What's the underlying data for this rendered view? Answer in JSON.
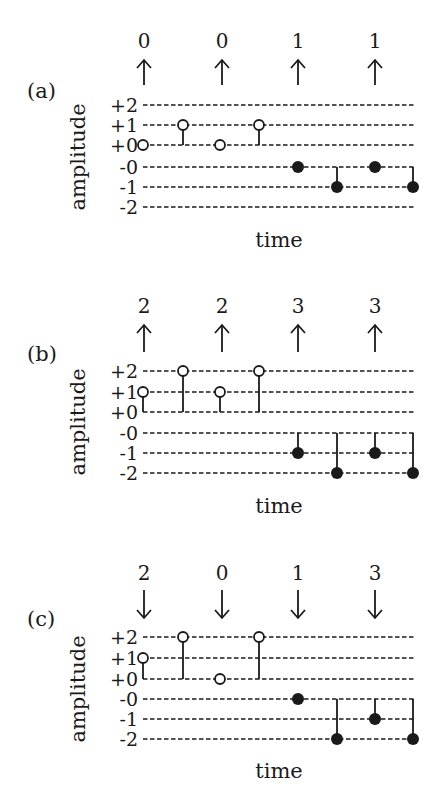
{
  "figure": {
    "level_labels": [
      "+2",
      "+1",
      "+0",
      "-0",
      "-1",
      "-2"
    ],
    "xlabel": "time",
    "ylabel": "amplitude",
    "sample_x": [
      143,
      183,
      220,
      259,
      298,
      337,
      375,
      413
    ],
    "symbol_x": [
      144,
      222,
      298,
      375
    ],
    "panels": [
      {
        "id": "a",
        "label": "(a)",
        "symbols": [
          "0",
          "0",
          "1",
          "1"
        ],
        "arrow_direction": "up",
        "arrow_glyph": "↑",
        "samples": [
          {
            "level": "+0",
            "fill": "open",
            "stem_to": null
          },
          {
            "level": "+1",
            "fill": "open",
            "stem_to": "+0"
          },
          {
            "level": "+0",
            "fill": "open",
            "stem_to": null
          },
          {
            "level": "+1",
            "fill": "open",
            "stem_to": "+0"
          },
          {
            "level": "-0",
            "fill": "filled",
            "stem_to": null
          },
          {
            "level": "-1",
            "fill": "filled",
            "stem_to": "-0"
          },
          {
            "level": "-0",
            "fill": "filled",
            "stem_to": null
          },
          {
            "level": "-1",
            "fill": "filled",
            "stem_to": "-0"
          }
        ]
      },
      {
        "id": "b",
        "label": "(b)",
        "symbols": [
          "2",
          "2",
          "3",
          "3"
        ],
        "arrow_direction": "up",
        "arrow_glyph": "↑",
        "samples": [
          {
            "level": "+1",
            "fill": "open",
            "stem_to": "+0"
          },
          {
            "level": "+2",
            "fill": "open",
            "stem_to": "+0"
          },
          {
            "level": "+1",
            "fill": "open",
            "stem_to": "+0"
          },
          {
            "level": "+2",
            "fill": "open",
            "stem_to": "+0"
          },
          {
            "level": "-1",
            "fill": "filled",
            "stem_to": "-0"
          },
          {
            "level": "-2",
            "fill": "filled",
            "stem_to": "-0"
          },
          {
            "level": "-1",
            "fill": "filled",
            "stem_to": "-0"
          },
          {
            "level": "-2",
            "fill": "filled",
            "stem_to": "-0"
          }
        ]
      },
      {
        "id": "c",
        "label": "(c)",
        "symbols": [
          "2",
          "0",
          "1",
          "3"
        ],
        "arrow_direction": "down",
        "arrow_glyph": "↓",
        "samples": [
          {
            "level": "+1",
            "fill": "open",
            "stem_to": "+0"
          },
          {
            "level": "+2",
            "fill": "open",
            "stem_to": "+0"
          },
          {
            "level": "+0",
            "fill": "open",
            "stem_to": null
          },
          {
            "level": "+2",
            "fill": "open",
            "stem_to": "+0"
          },
          {
            "level": "-0",
            "fill": "filled",
            "stem_to": null
          },
          {
            "level": "-2",
            "fill": "filled",
            "stem_to": "-0"
          },
          {
            "level": "-1",
            "fill": "filled",
            "stem_to": "-0"
          },
          {
            "level": "-2",
            "fill": "filled",
            "stem_to": "-0"
          }
        ]
      }
    ]
  },
  "layout": {
    "panel_geometry": [
      {
        "level_y": [
          105,
          125,
          145,
          167,
          187,
          207
        ],
        "symbol_baseline": 48,
        "arrow_top": 60,
        "arrow_bottom": 85,
        "label_y": 98,
        "ylabel_center": 157,
        "time_baseline": 247
      },
      {
        "level_y": [
          371,
          392,
          412,
          433,
          453,
          473
        ],
        "symbol_baseline": 313,
        "arrow_top": 325,
        "arrow_bottom": 352,
        "label_y": 361,
        "ylabel_center": 422,
        "time_baseline": 513
      },
      {
        "level_y": [
          637,
          658,
          679,
          699,
          719,
          739
        ],
        "symbol_baseline": 580,
        "arrow_top": 590,
        "arrow_bottom": 618,
        "label_y": 626,
        "ylabel_center": 689,
        "time_baseline": 778
      }
    ],
    "line_x_start": 143,
    "line_x_end": 415,
    "colors": {
      "ink": "#1a1a1a",
      "background": "#ffffff"
    }
  }
}
